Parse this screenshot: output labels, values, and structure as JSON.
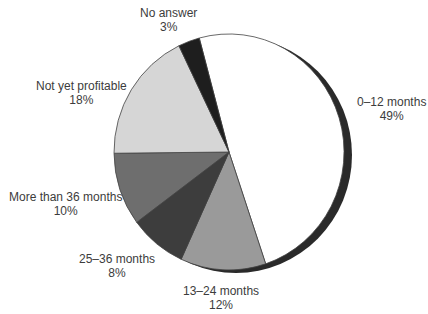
{
  "chart_data": {
    "type": "pie",
    "title": "",
    "start_angle_deg_clockwise_from_top": -15,
    "slices": [
      {
        "label": "0–12 months",
        "value": 49,
        "display": "49%",
        "color": "#ffffff"
      },
      {
        "label": "13–24 months",
        "value": 12,
        "display": "12%",
        "color": "#9a9a9a"
      },
      {
        "label": "25–36 months",
        "value": 8,
        "display": "8%",
        "color": "#3d3d3d"
      },
      {
        "label": "More than 36 months",
        "value": 10,
        "display": "10%",
        "color": "#6e6e6e"
      },
      {
        "label": "Not yet profitable",
        "value": 18,
        "display": "18%",
        "color": "#d6d6d6"
      },
      {
        "label": "No answer",
        "value": 3,
        "display": "3%",
        "color": "#1e1e1e"
      }
    ],
    "legend": "none (labels placed beside slices)"
  },
  "labels": {
    "s0": {
      "name": "0–12 months",
      "pct": "49%"
    },
    "s1": {
      "name": "13–24 months",
      "pct": "12%"
    },
    "s2": {
      "name": "25–36 months",
      "pct": "8%"
    },
    "s3": {
      "name": "More than 36 months",
      "pct": "10%"
    },
    "s4": {
      "name": "Not yet profitable",
      "pct": "18%"
    },
    "s5": {
      "name": "No answer",
      "pct": "3%"
    }
  }
}
